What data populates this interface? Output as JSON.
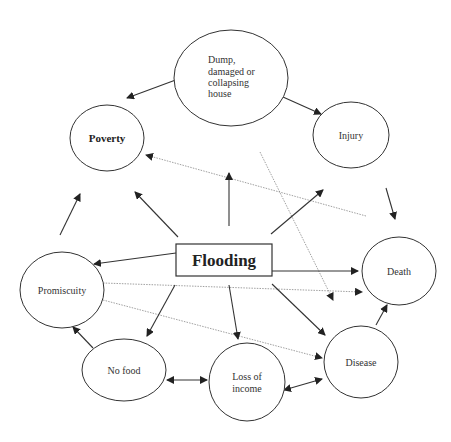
{
  "diagram": {
    "central_node": {
      "label": "Flooding"
    },
    "nodes": [
      {
        "id": "dump",
        "lines": [
          "Dump,",
          "damaged or",
          "collapsing",
          "house"
        ]
      },
      {
        "id": "poverty",
        "lines": [
          "Poverty"
        ]
      },
      {
        "id": "injury",
        "lines": [
          "Injury"
        ]
      },
      {
        "id": "death",
        "lines": [
          "Death"
        ]
      },
      {
        "id": "promiscuity",
        "lines": [
          "Promiscuity"
        ]
      },
      {
        "id": "disease",
        "lines": [
          "Disease"
        ]
      },
      {
        "id": "no_food",
        "lines": [
          "No food"
        ]
      },
      {
        "id": "loss_income",
        "lines": [
          "Loss of",
          "income"
        ]
      }
    ],
    "edges": [
      {
        "from": "Flooding",
        "to": "Poverty",
        "style": "solid"
      },
      {
        "from": "Flooding",
        "to": "Dump, damaged or collapsing house",
        "style": "solid"
      },
      {
        "from": "Flooding",
        "to": "Injury",
        "style": "solid"
      },
      {
        "from": "Flooding",
        "to": "Death",
        "style": "solid"
      },
      {
        "from": "Flooding",
        "to": "Promiscuity",
        "style": "solid"
      },
      {
        "from": "Flooding",
        "to": "No food",
        "style": "solid"
      },
      {
        "from": "Flooding",
        "to": "Loss of income",
        "style": "solid"
      },
      {
        "from": "Flooding",
        "to": "Disease",
        "style": "solid"
      },
      {
        "from": "Dump, damaged or collapsing house",
        "to": "Poverty",
        "style": "solid"
      },
      {
        "from": "Dump, damaged or collapsing house",
        "to": "Injury",
        "style": "solid"
      },
      {
        "from": "Injury",
        "to": "Death",
        "style": "solid"
      },
      {
        "from": "Disease",
        "to": "Death",
        "style": "solid"
      },
      {
        "from": "Promiscuity",
        "to": "Poverty",
        "style": "solid"
      },
      {
        "from": "No food",
        "to": "Promiscuity",
        "style": "solid"
      },
      {
        "from": "No food",
        "to": "Loss of income",
        "style": "solid-bidirectional"
      },
      {
        "from": "Loss of income",
        "to": "Disease",
        "style": "solid-bidirectional"
      },
      {
        "from": "Death",
        "to": "Poverty",
        "style": "dotted"
      },
      {
        "from": "Promiscuity",
        "to": "Death",
        "style": "dotted"
      },
      {
        "from": "Promiscuity",
        "to": "Disease",
        "style": "dotted"
      },
      {
        "from": "Injury area",
        "to": "Disease",
        "style": "dotted"
      }
    ]
  }
}
